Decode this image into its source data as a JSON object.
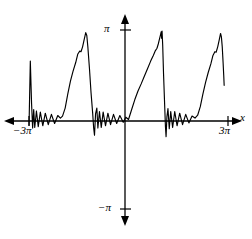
{
  "figure": {
    "title": "",
    "background_color": "#ffffff",
    "line_color": "#000000",
    "axis_color": "#000000",
    "width": 252,
    "height": 239
  },
  "labels": {
    "y_top": "π",
    "y_bottom": "−π",
    "x_left": "−3π",
    "x_right": "3π",
    "x_axis_name": "x"
  },
  "chart_data": {
    "type": "line",
    "title": "",
    "xlabel": "x",
    "ylabel": "",
    "grid": false,
    "legend": null,
    "xlim": [
      -9.4248,
      9.4248
    ],
    "ylim": [
      -3.1416,
      3.1416
    ],
    "xticks": [
      -9.4248,
      9.4248
    ],
    "xticklabels": [
      "−3π",
      "3π"
    ],
    "yticks": [
      -3.1416,
      3.1416
    ],
    "yticklabels": [
      "−π",
      "π"
    ],
    "series": [
      {
        "name": "partial-sum",
        "points": [
          [
            -9.42,
            -0.2
          ],
          [
            -9.3,
            2.05
          ],
          [
            -9.18,
            0.55
          ],
          [
            -9.08,
            -0.3
          ],
          [
            -8.98,
            0.35
          ],
          [
            -8.88,
            -0.28
          ],
          [
            -8.72,
            0.3
          ],
          [
            -8.55,
            -0.25
          ],
          [
            -8.35,
            0.26
          ],
          [
            -8.12,
            -0.22
          ],
          [
            -7.88,
            0.22
          ],
          [
            -7.6,
            -0.18
          ],
          [
            -7.3,
            0.18
          ],
          [
            -7.0,
            -0.14
          ],
          [
            -6.7,
            0.14
          ],
          [
            -6.45,
            0.05
          ],
          [
            -6.25,
            0.12
          ],
          [
            -6.0,
            0.4
          ],
          [
            -5.75,
            0.9
          ],
          [
            -5.5,
            1.35
          ],
          [
            -5.25,
            1.7
          ],
          [
            -5.0,
            2.0
          ],
          [
            -4.8,
            2.3
          ],
          [
            -4.62,
            2.4
          ],
          [
            -4.5,
            2.38
          ],
          [
            -4.35,
            2.55
          ],
          [
            -4.2,
            2.8
          ],
          [
            -4.05,
            3.05
          ],
          [
            -3.95,
            2.95
          ],
          [
            -3.85,
            2.55
          ],
          [
            -3.7,
            1.8
          ],
          [
            -3.55,
            0.95
          ],
          [
            -3.4,
            0.25
          ],
          [
            -3.3,
            -0.3
          ],
          [
            -3.22,
            -0.55
          ],
          [
            -3.12,
            0.2
          ],
          [
            -3.0,
            0.4
          ],
          [
            -2.9,
            -0.3
          ],
          [
            -2.75,
            0.28
          ],
          [
            -2.58,
            -0.28
          ],
          [
            -2.4,
            0.26
          ],
          [
            -2.18,
            -0.22
          ],
          [
            -1.95,
            0.22
          ],
          [
            -1.7,
            -0.18
          ],
          [
            -1.42,
            0.18
          ],
          [
            -1.12,
            -0.14
          ],
          [
            -0.82,
            0.14
          ],
          [
            -0.5,
            -0.1
          ],
          [
            -0.25,
            0.08
          ],
          [
            0.0,
            0.0
          ],
          [
            0.3,
            0.35
          ],
          [
            0.6,
            0.7
          ],
          [
            0.9,
            1.0
          ],
          [
            1.2,
            1.25
          ],
          [
            1.5,
            1.52
          ],
          [
            1.8,
            1.78
          ],
          [
            2.1,
            2.05
          ],
          [
            2.35,
            2.25
          ],
          [
            2.55,
            2.42
          ],
          [
            2.7,
            2.5
          ],
          [
            2.82,
            2.65
          ],
          [
            2.92,
            2.8
          ],
          [
            3.02,
            2.95
          ],
          [
            3.1,
            3.08
          ],
          [
            3.14,
            2.85
          ],
          [
            3.18,
            3.1
          ],
          [
            3.24,
            2.6
          ],
          [
            3.32,
            1.6
          ],
          [
            3.42,
            0.55
          ],
          [
            3.5,
            -0.25
          ],
          [
            3.56,
            -0.6
          ],
          [
            3.64,
            0.1
          ],
          [
            3.74,
            0.38
          ],
          [
            3.86,
            -0.32
          ],
          [
            4.0,
            0.28
          ],
          [
            4.18,
            -0.28
          ],
          [
            4.38,
            0.28
          ],
          [
            4.6,
            -0.22
          ],
          [
            4.85,
            0.22
          ],
          [
            5.12,
            -0.18
          ],
          [
            5.42,
            0.18
          ],
          [
            5.72,
            -0.12
          ],
          [
            6.02,
            0.12
          ],
          [
            6.3,
            0.05
          ],
          [
            6.55,
            0.15
          ],
          [
            6.8,
            0.45
          ],
          [
            7.05,
            0.9
          ],
          [
            7.3,
            1.3
          ],
          [
            7.55,
            1.65
          ],
          [
            7.8,
            1.95
          ],
          [
            8.0,
            2.25
          ],
          [
            8.18,
            2.38
          ],
          [
            8.3,
            2.36
          ],
          [
            8.45,
            2.55
          ],
          [
            8.6,
            2.8
          ],
          [
            8.72,
            3.02
          ],
          [
            8.8,
            2.9
          ],
          [
            8.88,
            2.55
          ],
          [
            8.96,
            2.0
          ],
          [
            9.02,
            1.55
          ],
          [
            9.06,
            1.2
          ]
        ]
      }
    ]
  }
}
